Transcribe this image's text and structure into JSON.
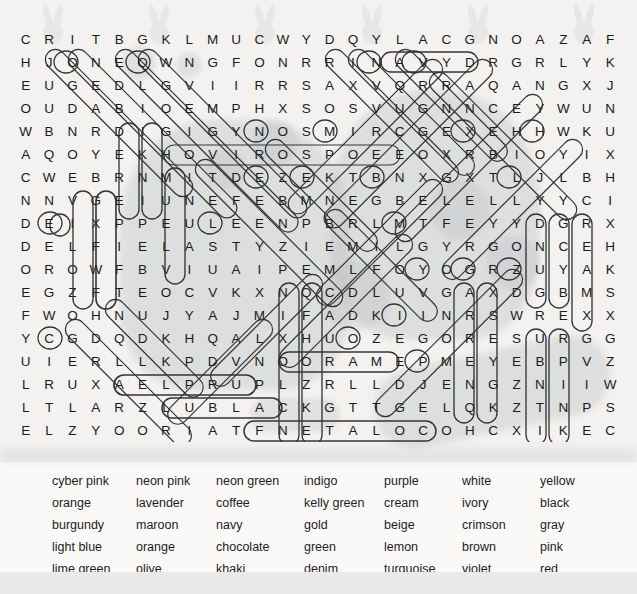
{
  "puzzle": {
    "type": "word-search",
    "rows": 18,
    "cols": 26,
    "grid": [
      "C R I T B G K L M U C W Y D Q Y L A C G N O A Z A F",
      "H J O N E Q W N G F O N R R I N A V Y D R G R L Y K",
      "E U G E D L G V I I R R S A X V Q R R A Q A N G X J",
      "O U D A B I O E M P H X S O S V U G N N C E Y W U N",
      "W B N R D I G I G Y N O S M I R C G E X E H H W K U",
      "A Q O Y E K H O V I R O S P O E E O X R B I O Y I X",
      "C W E B R N M I T D E Z E K T B N X G X T L J L B H",
      "N N V G E I U N E F E B M N E G B E L E L L Y Y C I",
      "D E I X P P E U L E E N P B R L M T F E Y Y D G R X",
      "D E L F I E L A S T Y Z I E M I L G Y R G O N C E H",
      "O R O W F B V I U A I P E M L F O Y O G R Z U Y A K",
      "E G Z F T E O C V K X N Q C D L U V G A X D G B M S",
      "F W O H N U J Y A J M I F A D K I I N R S W R E X X",
      "Y C G D Q D K H Q A L X H U O Z E G O R E S U R G G",
      "U I E R L L K P D V N O O R A M E P M E Y E B P V Z",
      "L R U X A E L P R U P L Z R L L D J E N G Z N I I W",
      "L T L A R Z L U B L A C K G T T G E L Q K Z T N P S",
      "E L Z Y O O R I A T F N E T A L O C O H C X I K E C"
    ]
  },
  "wordlist": {
    "columns": 7,
    "rows": [
      [
        "cyber pink",
        "neon pink",
        "neon green",
        "indigo",
        "purple",
        "white",
        "yellow"
      ],
      [
        "orange",
        "lavender",
        "coffee",
        "kelly green",
        "cream",
        "ivory",
        "black"
      ],
      [
        "burgundy",
        "maroon",
        "navy",
        "gold",
        "beige",
        "crimson",
        "gray"
      ],
      [
        "light blue",
        "orange",
        "chocolate",
        "green",
        "lemon",
        "brown",
        "pink"
      ],
      [
        "lime green",
        "olive",
        "khaki",
        "denim",
        "turquoise",
        "violet",
        "red"
      ]
    ]
  },
  "colors": {
    "page_background": "#f3f2f0",
    "letter": "#1b1b1b",
    "highlight_stroke": "#2b2b2b",
    "wordlist_background": "#ffffff"
  }
}
